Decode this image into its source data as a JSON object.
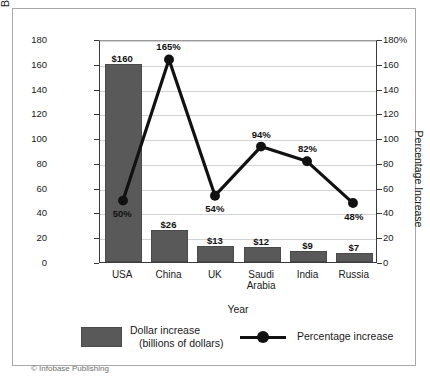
{
  "figure": {
    "copyright": "© Infobase Publishing",
    "top_sliver": "",
    "bar_color": "#595959",
    "line_color": "#111111",
    "grid_color": "#d2d2d2",
    "axis_color": "#3a3a3a"
  },
  "chart_data": {
    "type": "bar",
    "title": "",
    "categories": [
      "USA",
      "China",
      "UK",
      "Saudi\nArabia",
      "India",
      "Russia"
    ],
    "xlabel": "Year",
    "ylabel": "Billions of  U.S. Dollars",
    "ylabel_right": "Percentage Increase",
    "ylim": [
      0,
      180
    ],
    "ylim_right": [
      0,
      180
    ],
    "yticks": [
      "0",
      "20",
      "40",
      "60",
      "80",
      "100",
      "120",
      "140",
      "160",
      "180"
    ],
    "yticks_right": [
      "0",
      "20",
      "40",
      "60",
      "80",
      "100",
      "120",
      "140",
      "160",
      "180%"
    ],
    "grid": true,
    "legend_position": "bottom",
    "series": [
      {
        "name": "Dollar increase (billions of dollars)",
        "type": "bar",
        "axis": "left",
        "values": [
          160,
          26,
          13,
          12,
          9,
          7
        ],
        "labels": [
          "$160",
          "$26",
          "$13",
          "$12",
          "$9",
          "$7"
        ]
      },
      {
        "name": "Percentage increase",
        "type": "line",
        "axis": "right",
        "values": [
          50,
          165,
          54,
          94,
          82,
          48
        ],
        "labels": [
          "50%",
          "165%",
          "54%",
          "94%",
          "82%",
          "48%"
        ]
      }
    ]
  },
  "legend": {
    "bar_line1": "Dollar increase",
    "bar_line2": "(billions of dollars)",
    "line_label": "Percentage increase"
  }
}
